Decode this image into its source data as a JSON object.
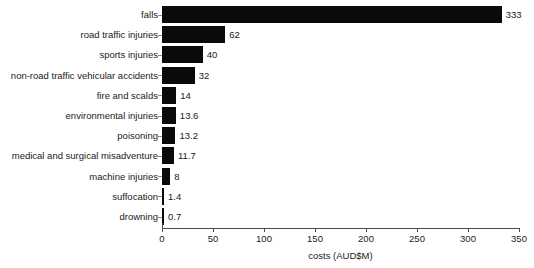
{
  "chart_data": {
    "type": "bar",
    "orientation": "horizontal",
    "title": "",
    "xlabel": "costs (AUD$M)",
    "ylabel": "",
    "xlim": [
      0,
      350
    ],
    "xticks": [
      0,
      50,
      100,
      150,
      200,
      250,
      300,
      350
    ],
    "xtick_labels": [
      "0",
      "50",
      "100",
      "150",
      "200",
      "250",
      "300",
      "350"
    ],
    "grid": false,
    "legend": null,
    "bar_color": "#0a0a0a",
    "background_color": "#ffffff",
    "categories": [
      "falls",
      "road traffic injuries",
      "sports injuries",
      "non-road traffic vehicular accidents",
      "fire and scalds",
      "environmental injuries",
      "poisoning",
      "medical and surgical misadventure",
      "machine injuries",
      "suffocation",
      "drowning"
    ],
    "values": [
      333,
      62,
      40,
      32,
      14,
      13.6,
      13.2,
      11.7,
      8,
      1.4,
      0.7
    ],
    "data_labels": [
      "333",
      "62",
      "40",
      "32",
      "14",
      "13.6",
      "13.2",
      "11.7",
      "8",
      "1.4",
      "0.7"
    ]
  }
}
